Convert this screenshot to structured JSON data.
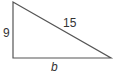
{
  "diagram": {
    "type": "right-triangle",
    "labels": {
      "vertical_leg": "9",
      "hypotenuse": "15",
      "horizontal_leg": "b"
    },
    "colors": {
      "stroke": "#555555",
      "text": "#333333",
      "background": "#ffffff"
    }
  }
}
